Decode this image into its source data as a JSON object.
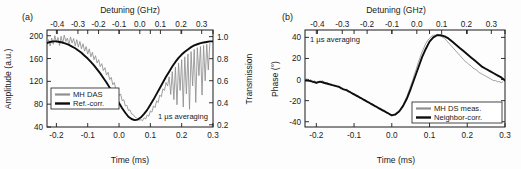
{
  "figure": {
    "panel_a_label": "(a)",
    "panel_b_label": "(b)",
    "note": "1 µs averaging",
    "colors": {
      "measured": "#8f8f8f",
      "corrected": "#0d0d0d",
      "axis": "#1a1a1a"
    }
  },
  "chart_data": [
    {
      "type": "line",
      "panel": "(a)",
      "title": "",
      "xlabel": "Time (ms)",
      "ylabel": "Amplitude (a.u.)",
      "y2label": "Transmission",
      "x2label": "Detuning (GHz)",
      "xlim": [
        -0.23,
        0.3
      ],
      "ylim": [
        40,
        210
      ],
      "y2lim": [
        0.18,
        1.06
      ],
      "x2lim": [
        -0.45,
        0.355
      ],
      "xticks": [
        "-0.2",
        "-0.1",
        "0.0",
        "0.1",
        "0.2",
        "0.3"
      ],
      "xtick_values": [
        -0.2,
        -0.1,
        0.0,
        0.1,
        0.2,
        0.3
      ],
      "yticks": [
        "40",
        "80",
        "120",
        "160",
        "200"
      ],
      "ytick_values": [
        40,
        80,
        120,
        160,
        200
      ],
      "y2ticks": [
        "0.2",
        "0.4",
        "0.6",
        "0.8",
        "1.0"
      ],
      "y2tick_values": [
        0.2,
        0.4,
        0.6,
        0.8,
        1.0
      ],
      "x2ticks": [
        "-0.4",
        "-0.3",
        "-0.2",
        "-0.1",
        "0.0",
        "0.1",
        "0.2",
        "0.3"
      ],
      "x2tick_values": [
        -0.4,
        -0.3,
        -0.2,
        -0.1,
        0.0,
        0.1,
        0.2,
        0.3
      ],
      "grid": false,
      "annotation": "1 µs averaging",
      "legend_position": "lower-left",
      "series": [
        {
          "name": "MH DAS",
          "style": "noisy-gray",
          "x": [
            -0.23,
            -0.225,
            -0.22,
            -0.215,
            -0.21,
            -0.205,
            -0.2,
            -0.195,
            -0.19,
            -0.185,
            -0.18,
            -0.175,
            -0.17,
            -0.165,
            -0.16,
            -0.155,
            -0.15,
            -0.145,
            -0.14,
            -0.135,
            -0.13,
            -0.125,
            -0.12,
            -0.115,
            -0.11,
            -0.105,
            -0.1,
            -0.095,
            -0.09,
            -0.085,
            -0.08,
            -0.075,
            -0.07,
            -0.065,
            -0.06,
            -0.055,
            -0.05,
            -0.045,
            -0.04,
            -0.035,
            -0.03,
            -0.025,
            -0.02,
            -0.015,
            -0.01,
            -0.005,
            0.0,
            0.005,
            0.01,
            0.015,
            0.02,
            0.025,
            0.03,
            0.035,
            0.04,
            0.045,
            0.05,
            0.055,
            0.06,
            0.065,
            0.07,
            0.075,
            0.08,
            0.085,
            0.09,
            0.095,
            0.1,
            0.105,
            0.11,
            0.115,
            0.12,
            0.125,
            0.13,
            0.135,
            0.14,
            0.145,
            0.15,
            0.155,
            0.16,
            0.165,
            0.17,
            0.175,
            0.18,
            0.185,
            0.19,
            0.195,
            0.2,
            0.205,
            0.21,
            0.215,
            0.22,
            0.225,
            0.23,
            0.235,
            0.24,
            0.245,
            0.25,
            0.255,
            0.26,
            0.265,
            0.27,
            0.275,
            0.28,
            0.285,
            0.29,
            0.295,
            0.3
          ],
          "y": [
            186,
            193,
            182,
            196,
            185,
            200,
            188,
            197,
            183,
            199,
            186,
            201,
            190,
            196,
            184,
            198,
            187,
            195,
            182,
            193,
            180,
            190,
            177,
            186,
            173,
            181,
            168,
            177,
            163,
            171,
            158,
            165,
            152,
            158,
            146,
            151,
            139,
            144,
            131,
            136,
            123,
            127,
            114,
            118,
            105,
            108,
            95,
            98,
            86,
            88,
            77,
            78,
            69,
            70,
            63,
            62,
            58,
            56,
            54,
            52,
            53,
            51,
            56,
            54,
            61,
            59,
            68,
            66,
            77,
            74,
            86,
            83,
            96,
            93,
            107,
            104,
            118,
            112,
            128,
            97,
            137,
            88,
            145,
            79,
            152,
            104,
            158,
            75,
            163,
            98,
            168,
            71,
            172,
            112,
            176,
            83,
            179,
            130,
            181,
            96,
            183,
            121,
            185,
            140,
            187
          ]
        },
        {
          "name": "Ref.-corr.",
          "style": "smooth-black",
          "x": [
            -0.23,
            -0.22,
            -0.21,
            -0.2,
            -0.19,
            -0.18,
            -0.17,
            -0.16,
            -0.15,
            -0.14,
            -0.13,
            -0.12,
            -0.11,
            -0.1,
            -0.09,
            -0.08,
            -0.07,
            -0.06,
            -0.05,
            -0.04,
            -0.03,
            -0.02,
            -0.01,
            0.0,
            0.01,
            0.02,
            0.03,
            0.04,
            0.05,
            0.06,
            0.07,
            0.08,
            0.09,
            0.1,
            0.11,
            0.12,
            0.13,
            0.14,
            0.15,
            0.16,
            0.17,
            0.18,
            0.19,
            0.2,
            0.21,
            0.22,
            0.23,
            0.24,
            0.25,
            0.26,
            0.27,
            0.28,
            0.29,
            0.3
          ],
          "y": [
            187,
            189,
            190,
            190,
            189,
            188,
            186,
            184,
            181,
            178,
            174,
            170,
            165,
            160,
            154,
            148,
            141,
            134,
            126,
            118,
            109,
            100,
            91,
            82,
            73,
            65,
            58,
            54,
            52,
            53,
            57,
            63,
            70,
            79,
            88,
            98,
            108,
            118,
            128,
            137,
            146,
            154,
            161,
            167,
            172,
            176,
            180,
            183,
            185,
            187,
            188,
            189,
            190,
            190
          ]
        }
      ]
    },
    {
      "type": "line",
      "panel": "(b)",
      "title": "",
      "xlabel": "Time (ms)",
      "ylabel": "Phase (°)",
      "x2label": "Detuning (GHz)",
      "xlim": [
        -0.23,
        0.3
      ],
      "ylim": [
        -45,
        47
      ],
      "x2lim": [
        -0.45,
        0.355
      ],
      "xticks": [
        "-0.2",
        "-0.1",
        "0.0",
        "0.1",
        "0.2",
        "0.3"
      ],
      "xtick_values": [
        -0.2,
        -0.1,
        0.0,
        0.1,
        0.2,
        0.3
      ],
      "yticks": [
        "-40",
        "-20",
        "0",
        "20",
        "40"
      ],
      "ytick_values": [
        -40,
        -20,
        0,
        20,
        40
      ],
      "x2ticks": [
        "-0.4",
        "-0.3",
        "-0.2",
        "-0.1",
        "0.0",
        "0.1",
        "0.2",
        "0.3"
      ],
      "x2tick_values": [
        -0.4,
        -0.3,
        -0.2,
        -0.1,
        0.0,
        0.1,
        0.2,
        0.3
      ],
      "grid": false,
      "annotation": "1 µs averaging",
      "legend_position": "lower-right",
      "series": [
        {
          "name": "MH DS meas.",
          "style": "noisy-gray",
          "x": [
            -0.23,
            -0.225,
            -0.22,
            -0.215,
            -0.21,
            -0.205,
            -0.2,
            -0.195,
            -0.19,
            -0.185,
            -0.18,
            -0.175,
            -0.17,
            -0.165,
            -0.16,
            -0.155,
            -0.15,
            -0.145,
            -0.14,
            -0.135,
            -0.13,
            -0.125,
            -0.12,
            -0.115,
            -0.11,
            -0.105,
            -0.1,
            -0.095,
            -0.09,
            -0.085,
            -0.08,
            -0.075,
            -0.07,
            -0.065,
            -0.06,
            -0.055,
            -0.05,
            -0.045,
            -0.04,
            -0.035,
            -0.03,
            -0.025,
            -0.02,
            -0.015,
            -0.01,
            -0.005,
            0.0,
            0.005,
            0.01,
            0.015,
            0.02,
            0.025,
            0.03,
            0.035,
            0.04,
            0.045,
            0.05,
            0.055,
            0.06,
            0.065,
            0.07,
            0.075,
            0.08,
            0.085,
            0.09,
            0.095,
            0.1,
            0.105,
            0.11,
            0.115,
            0.12,
            0.125,
            0.13,
            0.135,
            0.14,
            0.145,
            0.15,
            0.155,
            0.16,
            0.165,
            0.17,
            0.175,
            0.18,
            0.185,
            0.19,
            0.195,
            0.2,
            0.205,
            0.21,
            0.215,
            0.22,
            0.225,
            0.23,
            0.235,
            0.24,
            0.245,
            0.25,
            0.255,
            0.26,
            0.265,
            0.27,
            0.275,
            0.28,
            0.285,
            0.29,
            0.295,
            0.3
          ],
          "y": [
            -1,
            1,
            -2,
            0,
            -3,
            -1,
            -4,
            -2,
            -3,
            -1,
            -2,
            -4,
            -3,
            -5,
            -4,
            -6,
            -5,
            -7,
            -6,
            -9,
            -8,
            -10,
            -9,
            -12,
            -11,
            -14,
            -13,
            -16,
            -15,
            -18,
            -17,
            -20,
            -19,
            -22,
            -21,
            -24,
            -23,
            -26,
            -25,
            -28,
            -27,
            -30,
            -29,
            -32,
            -31,
            -33,
            -34,
            -33,
            -34,
            -32,
            -30,
            -27,
            -24,
            -20,
            -16,
            -11,
            -6,
            -1,
            5,
            10,
            16,
            21,
            26,
            30,
            34,
            37,
            39,
            41,
            42,
            42,
            43,
            42,
            41,
            40,
            39,
            37,
            35,
            33,
            31,
            29,
            27,
            25,
            23,
            21,
            19,
            17,
            16,
            14,
            13,
            11,
            10,
            9,
            7,
            6,
            5,
            4,
            3,
            2,
            1,
            0,
            -1,
            -1,
            -2,
            -2,
            -3,
            -2
          ]
        },
        {
          "name": "Neighbor-corr.",
          "style": "smooth-black",
          "x": [
            -0.23,
            -0.22,
            -0.21,
            -0.2,
            -0.19,
            -0.18,
            -0.17,
            -0.16,
            -0.15,
            -0.14,
            -0.13,
            -0.12,
            -0.11,
            -0.1,
            -0.09,
            -0.08,
            -0.07,
            -0.06,
            -0.05,
            -0.04,
            -0.03,
            -0.02,
            -0.01,
            0.0,
            0.01,
            0.02,
            0.03,
            0.04,
            0.05,
            0.06,
            0.07,
            0.08,
            0.09,
            0.1,
            0.11,
            0.12,
            0.13,
            0.14,
            0.15,
            0.16,
            0.17,
            0.18,
            0.19,
            0.2,
            0.21,
            0.22,
            0.23,
            0.24,
            0.25,
            0.26,
            0.27,
            0.28,
            0.29,
            0.3
          ],
          "y": [
            -1,
            -1,
            -2,
            -3,
            -2,
            -3,
            -4,
            -5,
            -6,
            -7,
            -9,
            -10,
            -12,
            -14,
            -16,
            -18,
            -20,
            -22,
            -24,
            -26,
            -28,
            -30,
            -32,
            -34,
            -33,
            -30,
            -25,
            -18,
            -9,
            1,
            11,
            21,
            29,
            36,
            40,
            42,
            42,
            41,
            39,
            36,
            33,
            30,
            27,
            24,
            21,
            18,
            15,
            12,
            10,
            8,
            6,
            4,
            2,
            -1
          ]
        }
      ]
    }
  ]
}
